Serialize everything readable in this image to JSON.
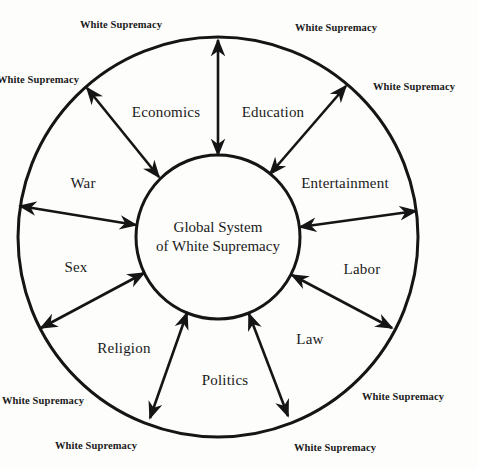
{
  "diagram": {
    "center": {
      "line1": "Global System",
      "line2": "of White Supremacy"
    },
    "sectors": [
      {
        "label": "Economics",
        "x": 166,
        "y": 112
      },
      {
        "label": "Education",
        "x": 273,
        "y": 112
      },
      {
        "label": "Entertainment",
        "x": 345,
        "y": 183
      },
      {
        "label": "Labor",
        "x": 362,
        "y": 269
      },
      {
        "label": "Law",
        "x": 310,
        "y": 339
      },
      {
        "label": "Politics",
        "x": 225,
        "y": 380
      },
      {
        "label": "Religion",
        "x": 124,
        "y": 348
      },
      {
        "label": "Sex",
        "x": 76,
        "y": 267
      },
      {
        "label": "War",
        "x": 83,
        "y": 183
      }
    ],
    "outer_labels": [
      {
        "text": "White Supremacy",
        "x": 121,
        "y": 24
      },
      {
        "text": "White Supremacy",
        "x": 336,
        "y": 27
      },
      {
        "text": "White Supremacy",
        "x": 38,
        "y": 79
      },
      {
        "text": "White Supremacy",
        "x": 414,
        "y": 86
      },
      {
        "text": "White Supremacy",
        "x": 43,
        "y": 400
      },
      {
        "text": "White Supremacy",
        "x": 403,
        "y": 396
      },
      {
        "text": "White Supremacy",
        "x": 96,
        "y": 445
      },
      {
        "text": "White Supremacy",
        "x": 335,
        "y": 447
      }
    ],
    "colors": {
      "line": "#151515",
      "background": "#fdfdfb"
    }
  }
}
